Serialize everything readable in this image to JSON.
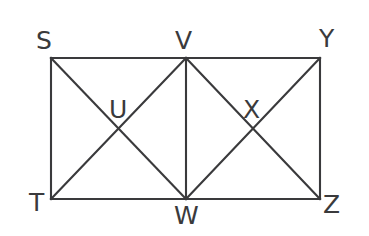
{
  "figure": {
    "type": "geometry-diagram",
    "background_color": "#ffffff",
    "stroke_color": "#3a3a3c",
    "stroke_width": 2.1,
    "canvas": {
      "width": 369,
      "height": 236
    },
    "points": [
      {
        "id": "S",
        "label": "S",
        "x": 51,
        "y": 58,
        "label_x": 36,
        "label_y": 28,
        "role": "rectangle-corner-top-left"
      },
      {
        "id": "V",
        "label": "V",
        "x": 186,
        "y": 58,
        "label_x": 175,
        "label_y": 28,
        "role": "top-midpoint"
      },
      {
        "id": "Y",
        "label": "Y",
        "x": 320,
        "y": 58,
        "label_x": 319,
        "label_y": 26,
        "role": "rectangle-corner-top-right"
      },
      {
        "id": "T",
        "label": "T",
        "x": 51,
        "y": 199,
        "label_x": 29,
        "label_y": 190,
        "role": "rectangle-corner-bottom-left"
      },
      {
        "id": "W",
        "label": "W",
        "x": 186,
        "y": 199,
        "label_x": 174,
        "label_y": 203,
        "role": "bottom-midpoint"
      },
      {
        "id": "Z",
        "label": "Z",
        "x": 320,
        "y": 199,
        "label_x": 323,
        "label_y": 192,
        "role": "rectangle-corner-bottom-right"
      },
      {
        "id": "U",
        "label": "U",
        "x": 118,
        "y": 128,
        "label_x": 109,
        "label_y": 97,
        "role": "left-square-diagonal-intersection"
      },
      {
        "id": "X",
        "label": "X",
        "x": 253,
        "y": 128,
        "label_x": 243,
        "label_y": 97,
        "role": "right-square-diagonal-intersection"
      }
    ],
    "segments": [
      {
        "id": "SY",
        "from": "S",
        "to": "Y",
        "kind": "edge",
        "name": "top-edge"
      },
      {
        "id": "YZ",
        "from": "Y",
        "to": "Z",
        "kind": "edge",
        "name": "right-edge"
      },
      {
        "id": "ZT",
        "from": "Z",
        "to": "T",
        "kind": "edge",
        "name": "bottom-edge"
      },
      {
        "id": "TS",
        "from": "T",
        "to": "S",
        "kind": "edge",
        "name": "left-edge"
      },
      {
        "id": "VW",
        "from": "V",
        "to": "W",
        "kind": "midline",
        "name": "vertical-midline"
      },
      {
        "id": "SW",
        "from": "S",
        "to": "W",
        "kind": "diagonal",
        "name": "left-square-diagonal-1"
      },
      {
        "id": "TV",
        "from": "T",
        "to": "V",
        "kind": "diagonal",
        "name": "left-square-diagonal-2"
      },
      {
        "id": "VZ",
        "from": "V",
        "to": "Z",
        "kind": "diagonal",
        "name": "right-square-diagonal-1"
      },
      {
        "id": "WY",
        "from": "W",
        "to": "Y",
        "kind": "diagonal",
        "name": "right-square-diagonal-2"
      }
    ]
  }
}
